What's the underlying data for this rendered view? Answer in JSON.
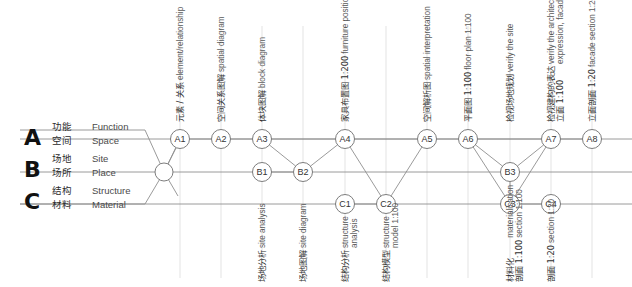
{
  "diagram": {
    "title_present": false,
    "colors": {
      "line": "#8f8f8f",
      "grid": "#dcdcdc",
      "node_stroke": "#6e6e6e",
      "text": "#3a3a3a",
      "background": "#ffffff"
    },
    "groups": [
      {
        "letter": "A",
        "rows": [
          {
            "cn": "功能",
            "en": "Function"
          },
          {
            "cn": "空间",
            "en": "Space"
          }
        ]
      },
      {
        "letter": "B",
        "rows": [
          {
            "cn": "场地",
            "en": "Site"
          },
          {
            "cn": "场所",
            "en": "Place"
          }
        ]
      },
      {
        "letter": "C",
        "rows": [
          {
            "cn": "结构",
            "en": "Structure"
          },
          {
            "cn": "材料",
            "en": "Material"
          }
        ]
      }
    ],
    "nodes": [
      {
        "id": "hub",
        "label": "",
        "x": 164,
        "y": 172,
        "r": 9
      },
      {
        "id": "A1",
        "label": "A1",
        "x": 180,
        "y": 139,
        "r": 9.5
      },
      {
        "id": "A2",
        "label": "A2",
        "x": 221,
        "y": 139,
        "r": 9.5
      },
      {
        "id": "A3",
        "label": "A3",
        "x": 262,
        "y": 139,
        "r": 9.5
      },
      {
        "id": "A4",
        "label": "A4",
        "x": 345,
        "y": 139,
        "r": 9.5
      },
      {
        "id": "A5",
        "label": "A5",
        "x": 427,
        "y": 139,
        "r": 9.5
      },
      {
        "id": "A6",
        "label": "A6",
        "x": 468,
        "y": 139,
        "r": 9.5
      },
      {
        "id": "A7",
        "label": "A7",
        "x": 551,
        "y": 139,
        "r": 9.5
      },
      {
        "id": "A8",
        "label": "A8",
        "x": 592,
        "y": 139,
        "r": 9.5
      },
      {
        "id": "B1",
        "label": "B1",
        "x": 262,
        "y": 172,
        "r": 9.5
      },
      {
        "id": "B2",
        "label": "B2",
        "x": 303,
        "y": 172,
        "r": 9.5
      },
      {
        "id": "B3",
        "label": "B3",
        "x": 510,
        "y": 172,
        "r": 9.5
      },
      {
        "id": "C1",
        "label": "C1",
        "x": 345,
        "y": 204,
        "r": 9.5
      },
      {
        "id": "C2",
        "label": "C2",
        "x": 386,
        "y": 204,
        "r": 9.5
      },
      {
        "id": "C3",
        "label": "C3",
        "x": 510,
        "y": 204,
        "r": 9.5
      },
      {
        "id": "C4",
        "label": "C4",
        "x": 551,
        "y": 204,
        "r": 9.5
      }
    ],
    "edges": [
      [
        "hub",
        "A1"
      ],
      [
        "A1",
        "A2"
      ],
      [
        "A2",
        "A3"
      ],
      [
        "A3",
        "A4"
      ],
      [
        "A4",
        "A5"
      ],
      [
        "A5",
        "A6"
      ],
      [
        "A6",
        "A7"
      ],
      [
        "A7",
        "A8"
      ],
      [
        "A3",
        "B2"
      ],
      [
        "B1",
        "B2"
      ],
      [
        "B2",
        "A4"
      ],
      [
        "A4",
        "C2"
      ],
      [
        "C1",
        "C2"
      ],
      [
        "C2",
        "A5"
      ],
      [
        "A6",
        "B3"
      ],
      [
        "A6",
        "C3"
      ],
      [
        "B3",
        "A7"
      ],
      [
        "C3",
        "A7"
      ],
      [
        "B3",
        "C3"
      ],
      [
        "C3",
        "C4"
      ]
    ],
    "rows": [
      {
        "id": "row-a",
        "y": 139,
        "x1": 20,
        "x2": 632
      },
      {
        "id": "row-b",
        "y": 172,
        "x1": 20,
        "x2": 632
      },
      {
        "id": "row-c",
        "y": 204,
        "x1": 20,
        "x2": 632
      }
    ],
    "gridlines_x": [
      180,
      221,
      262,
      303,
      345,
      386,
      427,
      468,
      510,
      551,
      592
    ],
    "grid_top": 26,
    "grid_bottom": 278,
    "captions_top": [
      {
        "node": "A1",
        "x": 180,
        "cn": "元素 / 关系",
        "en": "element/relationship"
      },
      {
        "node": "A2",
        "x": 221,
        "cn": "空间关系图解",
        "en": "spatial diagram"
      },
      {
        "node": "A3",
        "x": 262,
        "cn": "体块图解",
        "en": "block diagram"
      },
      {
        "node": "A4",
        "x": 345,
        "cn": "家具布置图 1:200",
        "en": "furniture position 1:200"
      },
      {
        "node": "A5",
        "x": 427,
        "cn": "空间解析图",
        "en": "spatial interpretation"
      },
      {
        "node": "A6",
        "x": 468,
        "cn": "平面图 1:100",
        "en": "floor plan 1:100"
      },
      {
        "node": "B3",
        "x": 510,
        "cn": "检视场地规划",
        "en": "verify the site"
      },
      {
        "node": "A7",
        "x": 551,
        "cn": "检视建构的表达\n立面 1:100",
        "en": "verify the architectonic\nexpression, facade 1:100"
      },
      {
        "node": "A8",
        "x": 592,
        "cn": "立面剖面 1:20",
        "en": "facade section 1:20"
      }
    ],
    "captions_bottom": [
      {
        "node": "B1",
        "x": 262,
        "cn": "场地分析",
        "en": "site analysis"
      },
      {
        "node": "B2",
        "x": 303,
        "cn": "场地图解",
        "en": "site diagram"
      },
      {
        "node": "C1",
        "x": 345,
        "cn": "结构分析",
        "en": "structure\nanalysis"
      },
      {
        "node": "C2",
        "x": 386,
        "cn": "结构模型",
        "en": "structure\nmodel 1:100"
      },
      {
        "node": "C3",
        "x": 510,
        "cn": "材料化\n剖面 1:100",
        "en": "materialisation\nsection 1:100"
      },
      {
        "node": "C4",
        "x": 551,
        "cn": "剖面 1:20",
        "en": "section 1:20"
      }
    ]
  }
}
